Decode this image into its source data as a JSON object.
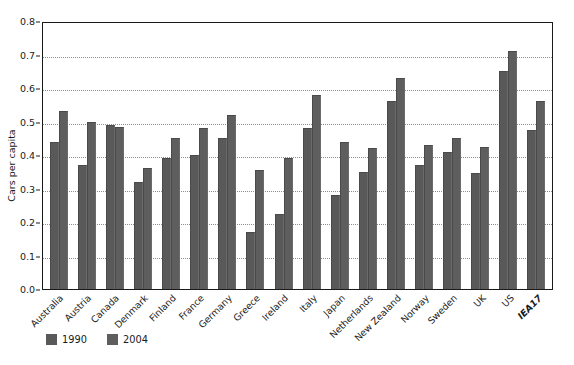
{
  "figure": {
    "title_remnant": "",
    "y_axis_label": "Cars per capita",
    "y_ticks": [
      "0.8",
      "0.7",
      "0.6",
      "0.5",
      "0.4",
      "0.3",
      "0.2",
      "0.1",
      "0.0"
    ],
    "legend": [
      {
        "label": "1990",
        "color": "#595959"
      },
      {
        "label": "2004",
        "color": "#5e5e5e"
      }
    ]
  },
  "chart_data": {
    "type": "bar",
    "title": "",
    "xlabel": "",
    "ylabel": "Cars per capita",
    "ylim": [
      0.0,
      0.8
    ],
    "ytick_step": 0.1,
    "grid": true,
    "legend_position": "below-axis-left",
    "categories": [
      "Australia",
      "Austria",
      "Canada",
      "Denmark",
      "Finland",
      "France",
      "Germany",
      "Greece",
      "Ireland",
      "Italy",
      "Japan",
      "Netherlands",
      "New Zealand",
      "Norway",
      "Sweden",
      "UK",
      "US",
      "IEA17"
    ],
    "emphasized_categories": [
      "IEA17"
    ],
    "series": [
      {
        "name": "1990",
        "color": "#595959",
        "values": [
          0.44,
          0.37,
          0.49,
          0.32,
          0.39,
          0.4,
          0.45,
          0.17,
          0.225,
          0.48,
          0.28,
          0.35,
          0.56,
          0.37,
          0.41,
          0.345,
          0.65,
          0.475
        ]
      },
      {
        "name": "2004",
        "color": "#5e5e5e",
        "values": [
          0.53,
          0.5,
          0.485,
          0.36,
          0.45,
          0.48,
          0.52,
          0.355,
          0.39,
          0.58,
          0.44,
          0.42,
          0.63,
          0.43,
          0.45,
          0.425,
          0.71,
          0.56
        ]
      }
    ]
  }
}
